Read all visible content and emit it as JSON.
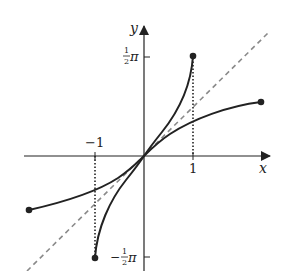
{
  "diagram": {
    "title": "",
    "axes": {
      "x_label": "x",
      "y_label": "y",
      "x_ticks": [
        {
          "value": -1,
          "label": "−1"
        },
        {
          "value": 1,
          "label": "1"
        }
      ],
      "y_ticks": [
        {
          "value": "pi/2",
          "label_num": "1",
          "label_den": "2",
          "label_sym": "π",
          "sign": ""
        },
        {
          "value": "-pi/2",
          "label_num": "1",
          "label_den": "2",
          "label_sym": "π",
          "sign": "−"
        }
      ]
    },
    "curves": [
      {
        "name": "steep-curve",
        "description": "arcsin-shaped curve from (-1, -π/2) to (1, π/2)",
        "style": "solid",
        "endpoints": "filled-dots"
      },
      {
        "name": "flat-curve",
        "description": "sin-shaped curve, reflection across y = x",
        "style": "solid",
        "endpoints": "filled-dots"
      },
      {
        "name": "line-y-equals-x",
        "description": "y = x",
        "style": "dashed"
      }
    ],
    "guides": [
      {
        "name": "dotted-guide-x-1",
        "description": "vertical dotted line at x = 1"
      },
      {
        "name": "dotted-guide-x-neg1",
        "description": "vertical dotted line at x = -1"
      }
    ],
    "colors": {
      "ink": "#222222",
      "dashed": "#8a8a8a",
      "background": "#ffffff"
    }
  }
}
